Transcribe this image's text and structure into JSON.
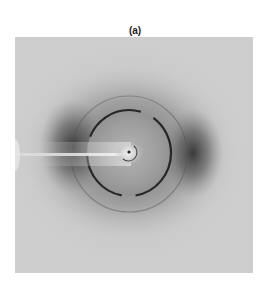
{
  "figure": {
    "label": "(a)",
    "type": "x-ray diffraction pattern",
    "colors": {
      "background": "#ffffff",
      "outer_field": "#c8c8c8",
      "inner_disk": "#9c9c9c",
      "ring": "#2a2a2a",
      "dark_lobes": "#4a4a4a",
      "beam_stop": "#e8e8e8"
    }
  }
}
